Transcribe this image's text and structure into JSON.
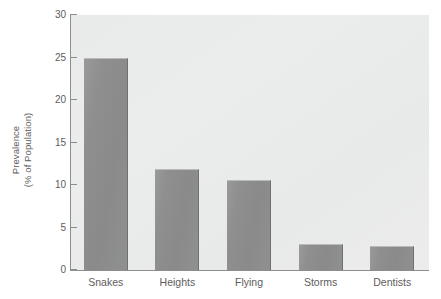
{
  "chart_data": {
    "type": "bar",
    "title": "",
    "xlabel": "",
    "ylabel": "Prevalence\n(% of Population)",
    "ylabel_lines": [
      "Prevalence",
      "(% of Population)"
    ],
    "categories": [
      "Snakes",
      "Heights",
      "Flying",
      "Storms",
      "Dentists"
    ],
    "values": [
      25.0,
      11.9,
      10.6,
      3.1,
      2.8
    ],
    "ylim": [
      0,
      30
    ],
    "yticks": [
      0,
      5,
      10,
      15,
      20,
      25,
      30
    ],
    "ytick_labels": [
      "0",
      "5",
      "10",
      "15",
      "20",
      "25",
      "30"
    ],
    "grid": false,
    "legend": false,
    "legend_position": "none",
    "series": [
      {
        "name": "Prevalence",
        "values": [
          25.0,
          11.9,
          10.6,
          3.1,
          2.8
        ]
      }
    ]
  },
  "colors": {
    "bar_fill": "#8f8f8f",
    "bar_edge": "#707070",
    "plot_background": "#eaebeb",
    "axis_line": "#8d8d8d",
    "text": "#5d5d5d",
    "page_background": "#ffffff"
  }
}
